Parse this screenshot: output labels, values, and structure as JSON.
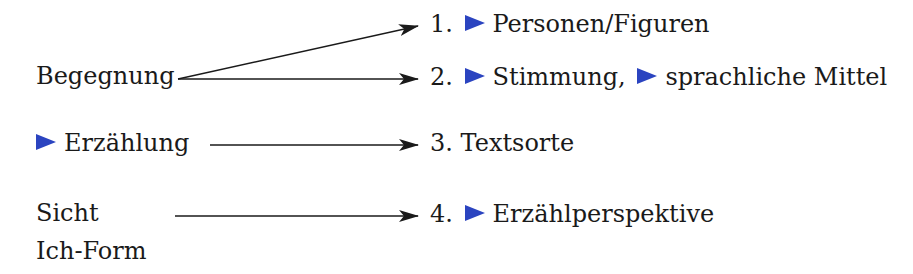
{
  "left": {
    "begegnung": "Begegnung",
    "erzaehlung": "Erzählung",
    "sicht": "Sicht",
    "ich_form": "Ich-Form"
  },
  "right": [
    {
      "num": "1.",
      "parts": [
        "Personen/Figuren"
      ]
    },
    {
      "num": "2.",
      "parts": [
        "Stimmung,",
        "sprachliche Mittel"
      ]
    },
    {
      "num": "3.",
      "parts": [
        "Textsorte"
      ]
    },
    {
      "num": "4.",
      "parts": [
        "Erzählperspektive"
      ]
    }
  ],
  "colors": {
    "marker": "#2b44c0",
    "text": "#1a1a1a",
    "arrow": "#1a1a1a"
  },
  "icons": {
    "marker": "blue-arrowhead-marker-icon",
    "connector": "arrow-icon"
  }
}
